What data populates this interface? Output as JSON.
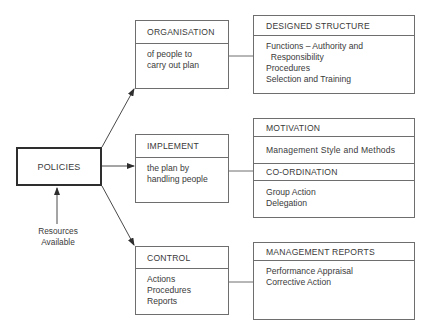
{
  "diagram": {
    "center": {
      "label": "POLICIES"
    },
    "input": {
      "line1": "Resources",
      "line2": "Available"
    },
    "stages": [
      {
        "title": "ORGANISATION",
        "lines": [
          "of people to",
          "carry out plan"
        ]
      },
      {
        "title": "IMPLEMENT",
        "lines": [
          "the plan by",
          "handling people"
        ]
      },
      {
        "title": "CONTROL",
        "lines": [
          "Actions",
          "Procedures",
          "Reports"
        ]
      }
    ],
    "details": [
      {
        "sections": [
          {
            "title": "DESIGNED STRUCTURE",
            "lines": [
              "Functions – Authority and",
              "  Responsibility",
              "Procedures",
              "Selection and Training"
            ]
          }
        ]
      },
      {
        "sections": [
          {
            "title": "MOTIVATION",
            "lines": [
              "Management Style and Methods"
            ]
          },
          {
            "title": "CO-ORDINATION",
            "lines": [
              "Group Action",
              "Delegation"
            ]
          }
        ]
      },
      {
        "sections": [
          {
            "title": "MANAGEMENT REPORTS",
            "lines": [
              "Performance Appraisal",
              "Corrective Action"
            ]
          }
        ]
      }
    ],
    "colors": {
      "line": "#6e6e6e",
      "text": "#3a3a3a",
      "thick_border": "#2e2e2e"
    }
  }
}
